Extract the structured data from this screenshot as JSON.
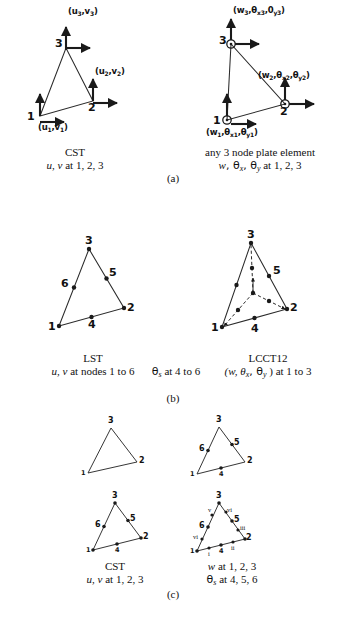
{
  "figure": {
    "part_labels": [
      "(a)",
      "(b)",
      "(c)"
    ]
  },
  "part_a": {
    "left": {
      "name": "CST",
      "caption_line1": "CST",
      "caption_line2_pre": "u, v",
      "caption_line2_post": " at 1, 2, 3",
      "node_labels": [
        "1",
        "2",
        "3"
      ],
      "dof_labels": [
        {
          "id": "node1",
          "text": "(u",
          "sub1": "1",
          "mid": ",v",
          "sub2": "1",
          "tail": ")"
        },
        {
          "id": "node2",
          "text": "(u",
          "sub1": "2",
          "mid": ",v",
          "sub2": "2",
          "tail": ")"
        },
        {
          "id": "node3",
          "text": "(u",
          "sub1": "3",
          "mid": ",v",
          "sub2": "3",
          "tail": ")"
        }
      ]
    },
    "right": {
      "name": "any 3 node plate element",
      "caption_line1": "any 3 node plate element",
      "caption_line2_pre": "w",
      "caption_line2_mid": ", θ",
      "caption_line2_sub1": "x",
      "caption_line2_mid2": ", θ",
      "caption_line2_sub2": "y",
      "caption_line2_post": " at 1, 2, 3",
      "node_labels": [
        "1",
        "2",
        "3"
      ],
      "dof_node1": {
        "a": "(w",
        "a_s": "1",
        "b": ",θ",
        "b_s": "x1",
        "c": ",θ",
        "c_s": "y1",
        "d": ")"
      },
      "dof_node2": {
        "a": "(w",
        "a_s": "2",
        "b": ",θ",
        "b_s": "x2",
        "c": ",θ",
        "c_s": "y2",
        "d": ")"
      },
      "dof_node3": {
        "a": "(w",
        "a_s": "3",
        "b": ",θ",
        "b_s": "x3",
        "c": ",0",
        "c_s": "y3",
        "d": ")"
      }
    }
  },
  "part_b": {
    "left": {
      "name": "LST",
      "caption_line1": "LST",
      "caption_line2_pre": "u, v",
      "caption_line2_post": " at nodes 1 to 6",
      "node_labels": [
        "1",
        "2",
        "3",
        "4",
        "5",
        "6"
      ]
    },
    "middle": {
      "caption_pre": "θ",
      "caption_sub": "s",
      "caption_post": " at 4 to 6"
    },
    "right": {
      "name": "LCCT12",
      "caption_line1": "LCCT12",
      "caption_line2_pre": "(w, θ",
      "caption_line2_sub1": "x",
      "caption_line2_mid": ", θ",
      "caption_line2_sub2": "y",
      "caption_line2_post": " ) at 1 to 3",
      "node_labels": [
        "1",
        "2",
        "3",
        "4",
        "5"
      ]
    }
  },
  "part_c": {
    "top_left": {
      "node_labels": [
        "1",
        "2",
        "3"
      ]
    },
    "top_right": {
      "node_labels": [
        "1",
        "2",
        "3",
        "4",
        "5",
        "6"
      ]
    },
    "bottom_left": {
      "node_labels": [
        "1",
        "2",
        "3",
        "4",
        "5",
        "6"
      ],
      "caption_line1": "CST",
      "caption_line2_pre": "u, v",
      "caption_line2_post": " at 1, 2, 3"
    },
    "bottom_right": {
      "node_labels": [
        "1",
        "2",
        "3",
        "4",
        "5",
        "6"
      ],
      "roman_labels": [
        "i",
        "ii",
        "iii",
        "vi",
        "v",
        "vi"
      ],
      "caption_line1_pre": "w",
      "caption_line1_post": " at 1, 2, 3",
      "caption_line2_pre": "θ",
      "caption_line2_sub": "s",
      "caption_line2_post": " at 4, 5, 6"
    }
  },
  "colors": {
    "ink": "#1a1a1a",
    "line": "#2b2b2b",
    "background": "#ffffff"
  }
}
